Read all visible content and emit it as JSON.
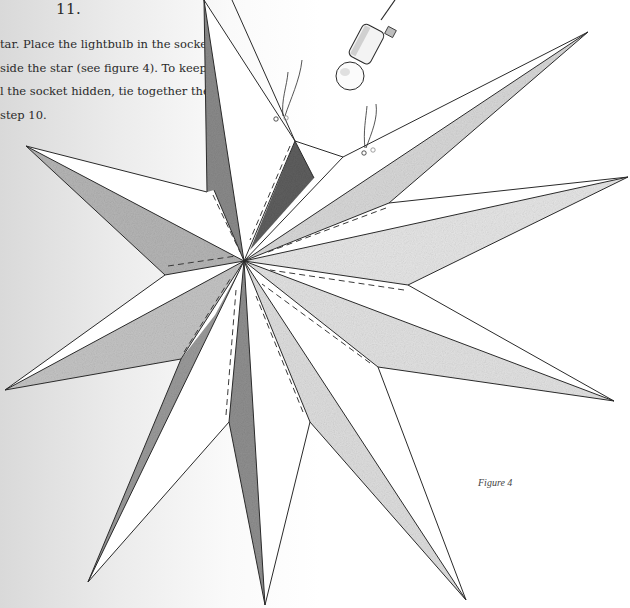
{
  "step": {
    "number": "11.",
    "lines": [
      "tar. Place the lightbulb in the socket",
      "side the star (see figure 4). To keep the",
      "l the socket hidden, tie together the",
      "step 10."
    ]
  },
  "figure": {
    "caption": "Figure 4",
    "icons": [
      "star-illustration",
      "lightbulb-icon",
      "socket-icon",
      "cord-icon",
      "tie-knot-icon"
    ]
  },
  "colors": {
    "ink": "#2a2a2a",
    "shade_dark": "#6e6e6e",
    "shade_light": "#c8c8c8",
    "paper": "#ffffff"
  }
}
